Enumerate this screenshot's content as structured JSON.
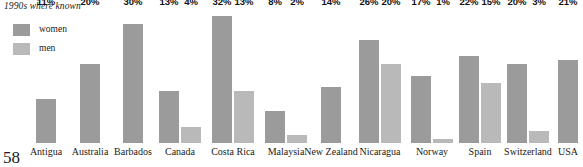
{
  "chart_data": {
    "type": "bar",
    "title": "1990s where known",
    "xlabel": "",
    "ylabel": "",
    "ylim": [
      0,
      34
    ],
    "grid": false,
    "legend_position": "top-left",
    "value_suffix": "%",
    "categories": [
      "Antigua",
      "Australia",
      "Barbados",
      "Canada",
      "Costa Rica",
      "Malaysia",
      "New Zealand",
      "Nicaragua",
      "Norway",
      "Spain",
      "Switzerland",
      "USA"
    ],
    "series": [
      {
        "name": "women",
        "color": "#9b9b9b",
        "values": [
          11,
          20,
          30,
          13,
          32,
          8,
          14,
          26,
          17,
          22,
          20,
          21
        ],
        "labels": [
          "11%",
          "20%",
          "30%",
          "13%",
          "32%",
          "8%",
          "14%",
          "26%",
          "17%",
          "22%",
          "20%",
          "21%"
        ]
      },
      {
        "name": "men",
        "color": "#b9b9b9",
        "values": [
          null,
          null,
          null,
          4,
          13,
          2,
          null,
          20,
          1,
          15,
          3,
          null
        ],
        "labels": [
          "",
          "",
          "",
          "4%",
          "13%",
          "2%",
          "",
          "20%",
          "1%",
          "15%",
          "3%",
          ""
        ]
      }
    ]
  },
  "legend": {
    "items": [
      {
        "label": "women",
        "color": "#9b9b9b"
      },
      {
        "label": "men",
        "color": "#b9b9b9"
      }
    ]
  },
  "page": {
    "number": "58"
  }
}
